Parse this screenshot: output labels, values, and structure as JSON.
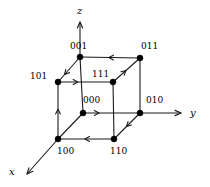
{
  "figure": {
    "background": "#ffffff",
    "stroke_color": "#1a1a1a",
    "vertex_color": "#000000",
    "width": 210,
    "height": 187
  },
  "axes": [
    {
      "name": "z-axis",
      "label": "z",
      "label_x": 77,
      "label_y": 6,
      "from_x": 80,
      "from_y": 57,
      "to_x": 80,
      "to_y": 22
    },
    {
      "name": "y-axis",
      "label": "y",
      "label_x": 190,
      "label_y": 108,
      "from_x": 140,
      "from_y": 113,
      "to_x": 181,
      "to_y": 113
    },
    {
      "name": "x-axis",
      "label": "x",
      "label_x": 9,
      "label_y": 167,
      "from_x": 58,
      "from_y": 139,
      "to_x": 27,
      "to_y": 174
    }
  ],
  "vertices": [
    {
      "id": "001",
      "label": "001",
      "x": 80,
      "y": 57,
      "label_x": 70,
      "label_y": 42
    },
    {
      "id": "011",
      "label": "011",
      "x": 140,
      "y": 58,
      "label_x": 141,
      "label_y": 42
    },
    {
      "id": "101",
      "label": "101",
      "x": 58,
      "y": 82,
      "label_x": 30,
      "label_y": 72
    },
    {
      "id": "111",
      "label": "111",
      "x": 113,
      "y": 82,
      "label_x": 92,
      "label_y": 70
    },
    {
      "id": "000",
      "label": "000",
      "x": 83,
      "y": 113,
      "label_x": 83,
      "label_y": 96
    },
    {
      "id": "010",
      "label": "010",
      "x": 140,
      "y": 113,
      "label_x": 146,
      "label_y": 96
    },
    {
      "id": "100",
      "label": "100",
      "x": 58,
      "y": 139,
      "label_x": 57,
      "label_y": 147
    },
    {
      "id": "110",
      "label": "110",
      "x": 114,
      "y": 139,
      "label_x": 110,
      "label_y": 147
    }
  ],
  "edges": [
    {
      "name": "edge-011-001",
      "from": "011",
      "to": "001",
      "arrow": true,
      "arrow_t": 0.52,
      "dashed": false
    },
    {
      "name": "edge-101-111",
      "from": "101",
      "to": "111",
      "arrow": true,
      "arrow_t": 0.36,
      "dashed": false
    },
    {
      "name": "edge-000-010",
      "from": "000",
      "to": "010",
      "arrow": true,
      "arrow_t": 0.28,
      "dashed": false
    },
    {
      "name": "edge-110-100",
      "from": "110",
      "to": "100",
      "arrow": true,
      "arrow_t": 0.52,
      "dashed": false
    },
    {
      "name": "edge-100-101",
      "from": "100",
      "to": "101",
      "arrow": true,
      "arrow_t": 0.52,
      "dashed": false
    },
    {
      "name": "edge-001-101",
      "from": "001",
      "to": "101",
      "arrow": true,
      "arrow_t": 0.7,
      "dashed": false
    },
    {
      "name": "edge-111-011",
      "from": "111",
      "to": "011",
      "arrow": true,
      "arrow_t": 0.48,
      "dashed": false
    },
    {
      "name": "edge-010-110",
      "from": "010",
      "to": "110",
      "arrow": true,
      "arrow_t": 0.52,
      "dashed": false
    },
    {
      "name": "edge-001-000",
      "from": "001",
      "to": "000",
      "arrow": false,
      "arrow_t": 0.5,
      "dashed": false
    },
    {
      "name": "edge-011-010",
      "from": "011",
      "to": "010",
      "arrow": false,
      "arrow_t": 0.5,
      "dashed": false
    },
    {
      "name": "edge-101-100",
      "from": "101",
      "to": "100",
      "arrow": false,
      "arrow_t": 0.5,
      "dashed": false
    },
    {
      "name": "edge-111-110",
      "from": "111",
      "to": "110",
      "arrow": false,
      "arrow_t": 0.5,
      "dashed": false
    },
    {
      "name": "edge-000-100-diag",
      "from": "000",
      "to": "100",
      "arrow": false,
      "arrow_t": 0.5,
      "dashed": false
    },
    {
      "name": "edge-001-101-diag-dup",
      "from": "011",
      "to": "111",
      "arrow": false,
      "arrow_t": 0.5,
      "dashed": false
    },
    {
      "name": "edge-010-110-diag-dup",
      "from": "110",
      "to": "010",
      "arrow": false,
      "arrow_t": 0.5,
      "dashed": false
    },
    {
      "name": "edge-top-left-diag",
      "from": "001",
      "to": "101",
      "arrow": false,
      "arrow_t": 0.5,
      "dashed": false
    }
  ],
  "vertex_radius": 3.0,
  "stroke_width": 1.1
}
